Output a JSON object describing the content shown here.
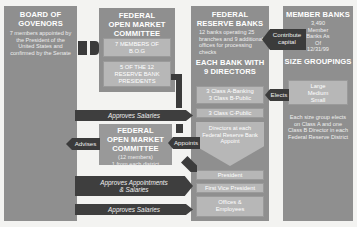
{
  "board": {
    "title_line1": "BOARD OF",
    "title_line2": "GOVENORS",
    "description": "7 members appointed by the President of the United States and confirmed by the Senate"
  },
  "fomc_top": {
    "title_line1": "FEDERAL",
    "title_line2": "OPEN MARKET",
    "title_line3": "COMMITTEE",
    "member_group_1": "7 MEMBERS OF B.O.G",
    "member_group_2": "5 OF THE 12 RESERVE BANK PRESIDENTS"
  },
  "reserve_banks": {
    "title_line1": "FEDERAL",
    "title_line2": "RESERVE BANKS",
    "description": "12 banks operating 25 branches and 9 additional offices for processing checks",
    "subtitle_line1": "EACH BANK WITH",
    "subtitle_line2": "9 DIRECTORS",
    "class_ab_line1": "3 Class A-Banking",
    "class_ab_line2": "3 Class B-Public",
    "class_c": "3 Class C-Public",
    "directors_appoint": "Directors at each Federal Reserve Bank Appoint",
    "president": "President",
    "first_vp": "First Vice President",
    "officers": "Offices & Employees"
  },
  "member_banks": {
    "title": "MEMBER BANKS",
    "count_text": "3,490 Member Banks As Of 12/31/99",
    "size_title": "SIZE GROUPINGS",
    "sizes": [
      "Large",
      "Medium",
      "Small"
    ],
    "description": "Each size group elects on Class A and one Class B Director in each Federal Reserve District"
  },
  "fomc_bottom": {
    "title_line1": "FEDERAL",
    "title_line2": "OPEN MARKET",
    "title_line3": "COMMITTEE",
    "members": "(12 members)",
    "district": "1 from each district"
  },
  "arrows": {
    "contribute_line1": "Contribute",
    "contribute_line2": "capital",
    "elects": "Elects",
    "approves_salaries_1": "Approves Salaries",
    "advises": "Advises",
    "appoints": "Appoints",
    "approves_appointments_line1": "Approves Appointments",
    "approves_appointments_line2": "& Salaries",
    "approves_salaries_2": "Approves Salaries"
  },
  "colors": {
    "box": "#8f8f8f",
    "inner": "#b7b7b7",
    "dark": "#3e3e3e",
    "background": "#f3f3f1"
  }
}
